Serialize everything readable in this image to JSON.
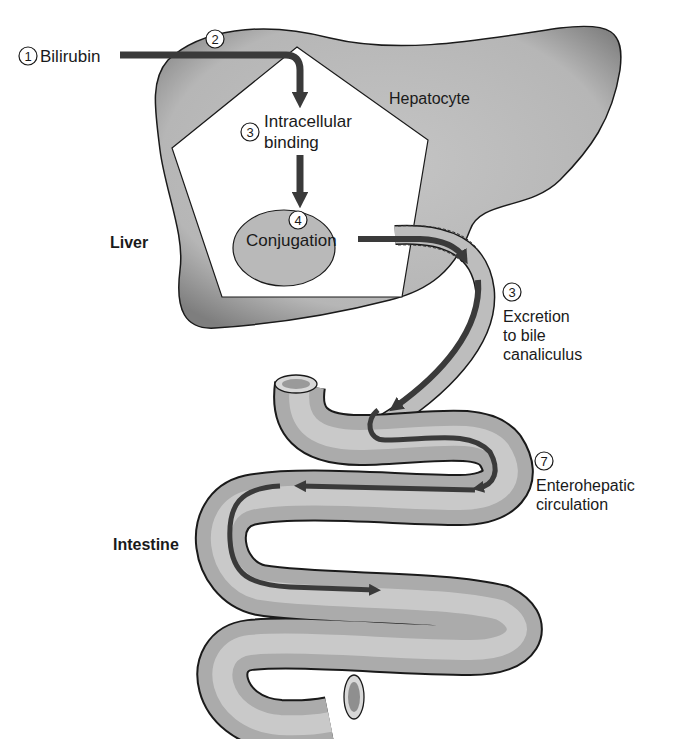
{
  "diagram": {
    "organs": {
      "liver": "Liver",
      "hepatocyte": "Hepatocyte",
      "intestine": "Intestine"
    },
    "steps": [
      {
        "number": "1",
        "label": "Bilirubin"
      },
      {
        "number": "2",
        "label": ""
      },
      {
        "number": "3",
        "label_lines": [
          "Intracellular",
          "binding"
        ]
      },
      {
        "number": "4",
        "label": "Conjugation"
      },
      {
        "number": "3",
        "label_lines": [
          "Excretion",
          "to bile",
          "canaliculus"
        ]
      },
      {
        "number": "7",
        "label_lines": [
          "Enterohepatic",
          "circulation"
        ]
      }
    ],
    "colors": {
      "organ_fill": "#b9b9b9",
      "organ_shade": "#8c8c8c",
      "arrow": "#3a3a3a",
      "outline": "#1a1a1a",
      "background": "#ffffff"
    }
  }
}
